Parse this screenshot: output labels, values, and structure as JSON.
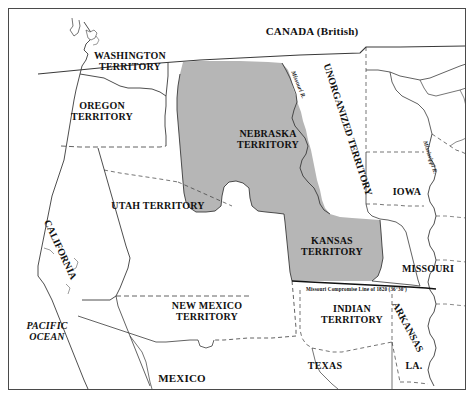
{
  "map": {
    "title_region": "CANADA (British)",
    "background_color": "#ffffff",
    "shaded_color": "#b6b6b6",
    "line_color": "#3a3a3a",
    "frame_color": "#4a4a4a",
    "labels": {
      "canada": "CANADA (British)",
      "washington": "WASHINGTON\nTERRITORY",
      "oregon": "OREGON\nTERRITORY",
      "utah": "UTAH TERRITORY",
      "california": "CALIFORNIA",
      "new_mexico": "NEW MEXICO\nTERRITORY",
      "pacific_ocean": "PACIFIC\nOCEAN",
      "mexico": "MEXICO",
      "nebraska": "NEBRASKA\nTERRITORY",
      "kansas": "KANSAS\nTERRITORY",
      "unorganized": "UNORGANIZED\nTERRITORY",
      "iowa": "IOWA",
      "missouri": "MISSOURI",
      "indian": "INDIAN\nTERRITORY",
      "texas": "TEXAS",
      "arkansas": "ARKANSAS",
      "louisiana": "LA.",
      "compromise_line": "Missouri Compromise Line of 1820 (36°30')",
      "missouri_river": "Missouri R.",
      "mississippi_river": "Mississippi R."
    }
  }
}
